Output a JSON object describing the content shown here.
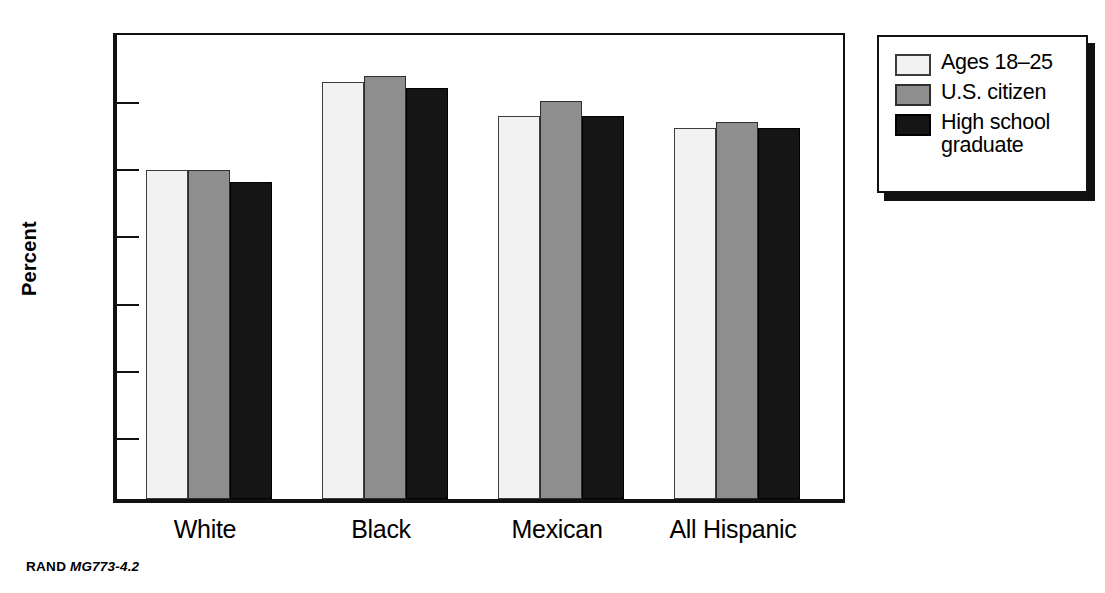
{
  "chart_data": {
    "type": "bar",
    "title": "",
    "subtitle": "",
    "xlabel": "",
    "ylabel": "Percent",
    "ylim": [
      0,
      70
    ],
    "yticks": [
      0,
      10,
      20,
      30,
      40,
      50,
      60,
      70
    ],
    "ytick_labels": [
      "0",
      "10",
      "20",
      "30",
      "40",
      "50",
      "60",
      "70"
    ],
    "grid": false,
    "legend_position": "right-outside",
    "categories": [
      "White",
      "Black",
      "Mexican",
      "All Hispanic"
    ],
    "series": [
      {
        "name": "Ages 18–25",
        "color": "#f2f2f2",
        "values": [
          49.0,
          62.1,
          57.0,
          55.2
        ]
      },
      {
        "name": "U.S. citizen",
        "color": "#8e8e8e",
        "values": [
          49.0,
          63.0,
          59.3,
          56.2
        ]
      },
      {
        "name": "High school\ngraduate",
        "color": "#151515",
        "values": [
          47.2,
          61.2,
          57.0,
          55.3
        ]
      }
    ],
    "legend_entries": [
      "Ages 18–25",
      "U.S. citizen",
      "High school\ngraduate"
    ],
    "annotations": []
  },
  "footer": {
    "source": "RAND",
    "figure_code": "MG773-4.2"
  },
  "colors": {
    "axis": "#111111",
    "series_light": "#f2f2f2",
    "series_gray": "#8e8e8e",
    "series_dark": "#151515",
    "background": "#ffffff"
  }
}
